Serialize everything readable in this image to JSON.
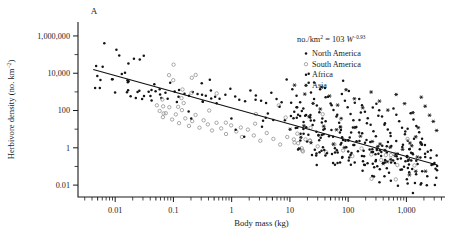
{
  "figure": {
    "panel_label": "A",
    "width": 452,
    "height": 248,
    "background": "#ffffff"
  },
  "equation": {
    "prefix": "no./km",
    "prefix_sup": "2",
    "equals": " = 103 ",
    "variable": "W",
    "exponent": "−0.93"
  },
  "legend": {
    "position": "top-right",
    "items": [
      {
        "label": "North America",
        "marker": "filled-dot",
        "color": "#141414"
      },
      {
        "label": "South America",
        "marker": "open-circle",
        "color": "#8d8d8d"
      },
      {
        "label": "Africa",
        "marker": "filled-dot",
        "color": "#141414"
      },
      {
        "label": "Asia",
        "marker": "star",
        "color": "#141414"
      }
    ]
  },
  "axes": {
    "x": {
      "title": "Body mass (kg)",
      "scale": "log10",
      "tick_labels": [
        "0.01",
        "0.1",
        "1",
        "10",
        "100",
        "1,000"
      ],
      "tick_values": [
        0.01,
        0.1,
        1,
        10,
        100,
        1000
      ],
      "range": [
        0.0023,
        4600
      ]
    },
    "y": {
      "title_main": "Herbivore density (no. km",
      "title_sup": "−2",
      "title_tail": ")",
      "scale": "log10",
      "tick_labels": [
        "1,000,000",
        "10,000",
        "100",
        "1",
        "0.01"
      ],
      "tick_values": [
        1000000,
        10000,
        100,
        1,
        0.01
      ],
      "range": [
        0.0023,
        5600000
      ]
    }
  },
  "chart_data": {
    "type": "scatter",
    "title": "A",
    "xlabel": "Body mass (kg)",
    "ylabel": "Herbivore density (no. km−2)",
    "xscale": "log",
    "yscale": "log",
    "xlim": [
      0.0023,
      4600
    ],
    "ylim": [
      0.0023,
      5600000
    ],
    "grid": false,
    "legend_position": "top-right",
    "annotations": [
      "no./km2 = 103 W−0.93"
    ],
    "fit_line": {
      "label": "no./km2 = 103 W^-0.93",
      "intercept": 103,
      "slope": -0.93,
      "x_start": 0.0042,
      "x_end": 3400,
      "y_start": 16000,
      "y_end": 0.12
    },
    "series": [
      {
        "name": "North America",
        "marker": "filled-dot",
        "color": "#141414",
        "points": [
          [
            0.0105,
            180000
          ],
          [
            0.021,
            60000
          ],
          [
            0.031,
            88000
          ],
          [
            0.013,
            9200
          ],
          [
            0.0165,
            3300
          ],
          [
            0.026,
            1150
          ],
          [
            0.029,
            420
          ],
          [
            0.042,
            1250
          ],
          [
            0.047,
            2600
          ],
          [
            0.058,
            1400
          ],
          [
            0.062,
            470
          ],
          [
            0.073,
            900
          ],
          [
            0.088,
            3100
          ],
          [
            0.105,
            1050
          ],
          [
            0.125,
            1250
          ],
          [
            0.155,
            800
          ],
          [
            0.185,
            620
          ],
          [
            0.215,
            980
          ],
          [
            0.26,
            760
          ],
          [
            0.31,
            700
          ],
          [
            0.36,
            620
          ],
          [
            0.44,
            1200
          ],
          [
            0.52,
            540
          ],
          [
            0.62,
            430
          ],
          [
            0.78,
            700
          ],
          [
            0.95,
            1450
          ],
          [
            1.15,
            560
          ],
          [
            1.35,
            380
          ],
          [
            1.7,
            310
          ],
          [
            2.1,
            1200
          ],
          [
            2.6,
            640
          ],
          [
            3.2,
            330
          ],
          [
            3.9,
            250
          ],
          [
            4.8,
            900
          ],
          [
            5.9,
            420
          ],
          [
            7.2,
            280
          ],
          [
            8.8,
            4600
          ],
          [
            10.5,
            260
          ],
          [
            13.0,
            150
          ],
          [
            16.0,
            95
          ],
          [
            21.0,
            9400
          ],
          [
            26.0,
            3200
          ],
          [
            33.0,
            1400
          ],
          [
            41.0,
            520
          ],
          [
            52.0,
            190
          ],
          [
            65.0,
            60
          ],
          [
            82.0,
            3900
          ],
          [
            103.0,
            1100
          ],
          [
            130.0,
            260
          ],
          [
            165.0,
            78
          ],
          [
            210.0,
            21
          ],
          [
            265.0,
            145
          ],
          [
            330.0,
            52
          ],
          [
            420.0,
            17
          ],
          [
            530.0,
            6.2
          ],
          [
            670.0,
            2.3
          ],
          [
            850.0,
            1.1
          ],
          [
            1050.0,
            10.5
          ],
          [
            1350.0,
            3.1
          ],
          [
            1700.0,
            0.85
          ],
          [
            2100.0,
            0.32
          ],
          [
            2700.0,
            0.12
          ]
        ]
      },
      {
        "name": "South America",
        "marker": "open-circle",
        "color": "#8d8d8d",
        "points": [
          [
            0.052,
            190
          ],
          [
            0.058,
            95
          ],
          [
            0.066,
            44
          ],
          [
            0.074,
            72
          ],
          [
            0.085,
            150
          ],
          [
            0.095,
            33
          ],
          [
            0.11,
            62
          ],
          [
            0.125,
            21
          ],
          [
            0.14,
            105
          ],
          [
            0.16,
            38
          ],
          [
            0.185,
            15
          ],
          [
            0.21,
            27
          ],
          [
            0.24,
            58
          ],
          [
            0.28,
            12
          ],
          [
            0.33,
            30
          ],
          [
            0.39,
            18
          ],
          [
            0.46,
            8.5
          ],
          [
            0.55,
            22
          ],
          [
            0.66,
            11
          ],
          [
            0.8,
            5.5
          ],
          [
            0.98,
            16
          ],
          [
            1.2,
            7.5
          ],
          [
            1.5,
            3.8
          ],
          [
            1.9,
            9.5
          ],
          [
            2.4,
            4.6
          ],
          [
            3.1,
            2.4
          ],
          [
            4.0,
            6.2
          ],
          [
            5.2,
            3.0
          ],
          [
            6.8,
            1.5
          ],
          [
            9.0,
            3.8
          ],
          [
            12.0,
            1.9
          ],
          [
            16.0,
            0.95
          ],
          [
            22.0,
            2.4
          ],
          [
            30.0,
            1.2
          ],
          [
            42.0,
            0.58
          ],
          [
            58.0,
            1.5
          ],
          [
            82.0,
            0.72
          ],
          [
            118.0,
            0.36
          ],
          [
            170.0,
            0.92
          ],
          [
            250.0,
            0.44
          ],
          [
            370.0,
            0.22
          ]
        ]
      },
      {
        "name": "Africa",
        "marker": "filled-dot",
        "color": "#141414",
        "points": [
          [
            11.0,
            1400
          ],
          [
            13.0,
            620
          ],
          [
            15.0,
            280
          ],
          [
            17.0,
            130
          ],
          [
            19.0,
            58
          ],
          [
            21.0,
            3100
          ],
          [
            23.0,
            920
          ],
          [
            26.0,
            410
          ],
          [
            29.0,
            185
          ],
          [
            32.0,
            82
          ],
          [
            36.0,
            37
          ],
          [
            40.0,
            1600
          ],
          [
            45.0,
            540
          ],
          [
            50.0,
            240
          ],
          [
            56.0,
            108
          ],
          [
            63.0,
            48
          ],
          [
            70.0,
            22
          ],
          [
            78.0,
            760
          ],
          [
            88.0,
            330
          ],
          [
            98.0,
            150
          ],
          [
            110.0,
            66
          ],
          [
            123.0,
            30
          ],
          [
            138.0,
            13
          ],
          [
            155.0,
            420
          ],
          [
            173.0,
            190
          ],
          [
            194.0,
            86
          ],
          [
            217.0,
            39
          ],
          [
            243.0,
            17
          ],
          [
            272.0,
            7.8
          ],
          [
            305.0,
            230
          ],
          [
            341.0,
            105
          ],
          [
            382.0,
            48
          ],
          [
            428.0,
            21
          ],
          [
            479.0,
            9.6
          ],
          [
            536.0,
            4.3
          ],
          [
            600.0,
            130
          ],
          [
            672.0,
            59
          ],
          [
            752.0,
            27
          ],
          [
            842.0,
            12
          ],
          [
            943.0,
            5.4
          ],
          [
            1056.0,
            2.4
          ],
          [
            1182.0,
            72
          ],
          [
            1323.0,
            33
          ],
          [
            1481.0,
            15
          ],
          [
            1658.0,
            6.8
          ],
          [
            1857.0,
            3.1
          ],
          [
            2079.0,
            1.4
          ],
          [
            2328.0,
            0.62
          ],
          [
            2606.0,
            0.28
          ],
          [
            2917.0,
            0.13
          ]
        ]
      },
      {
        "name": "Asia",
        "marker": "star",
        "color": "#141414",
        "points": [
          [
            12.0,
            2300
          ],
          [
            18.0,
            760
          ],
          [
            25.0,
            240
          ],
          [
            35.0,
            1800
          ],
          [
            48.0,
            600
          ],
          [
            66.0,
            195
          ],
          [
            92.0,
            1300
          ],
          [
            128.0,
            430
          ],
          [
            178.0,
            140
          ],
          [
            248.0,
            980
          ],
          [
            345.0,
            320
          ],
          [
            480.0,
            105
          ],
          [
            668.0,
            720
          ],
          [
            930.0,
            235
          ],
          [
            1294.0,
            77
          ],
          [
            1800.0,
            520
          ],
          [
            2100.0,
            170
          ],
          [
            2500.0,
            56
          ],
          [
            2900.0,
            26
          ],
          [
            3300.0,
            8.5
          ],
          [
            1600.0,
            12
          ],
          [
            1450.0,
            3.9
          ],
          [
            1150.0,
            1.8
          ],
          [
            860.0,
            0.82
          ],
          [
            640.0,
            0.38
          ],
          [
            470.0,
            0.18
          ]
        ]
      }
    ]
  }
}
